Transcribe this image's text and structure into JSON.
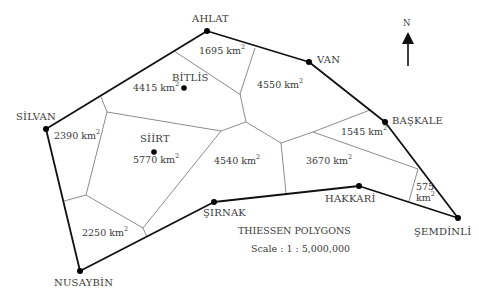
{
  "map": {
    "title": "THIESSEN POLYGONS",
    "scale": "Scale : 1 : 5,000,000",
    "north_label": "N",
    "unit": "km",
    "unit_exponent": "2",
    "stations": [
      {
        "name": "AHLAT",
        "x": 207,
        "y": 31
      },
      {
        "name": "VAN",
        "x": 309,
        "y": 62
      },
      {
        "name": "BAŞKALE",
        "x": 385,
        "y": 122
      },
      {
        "name": "ŞEMDİNLİ",
        "x": 458,
        "y": 218
      },
      {
        "name": "HAKKARİ",
        "x": 359,
        "y": 186
      },
      {
        "name": "ŞIRNAK",
        "x": 214,
        "y": 202
      },
      {
        "name": "NUSAYBİN",
        "x": 80,
        "y": 271
      },
      {
        "name": "SİLVAN",
        "x": 46,
        "y": 129
      },
      {
        "name": "BİTLİS",
        "x": 184,
        "y": 88
      },
      {
        "name": "SİİRT",
        "x": 154,
        "y": 152
      }
    ],
    "areas": [
      {
        "station": "AHLAT",
        "value": "1695"
      },
      {
        "station": "BİTLİS",
        "value": "4415"
      },
      {
        "station": "VAN",
        "value": "4550"
      },
      {
        "station": "SİLVAN",
        "value": "2390"
      },
      {
        "station": "SİİRT",
        "value": "5770"
      },
      {
        "station": "ŞIRNAK",
        "value": "4540"
      },
      {
        "station": "BAŞKALE",
        "value": "1545"
      },
      {
        "station": "HAKKARİ",
        "value": "3670"
      },
      {
        "station": "ŞEMDİNLİ",
        "value": "575"
      },
      {
        "station": "NUSAYBİN",
        "value": "2250"
      }
    ]
  }
}
